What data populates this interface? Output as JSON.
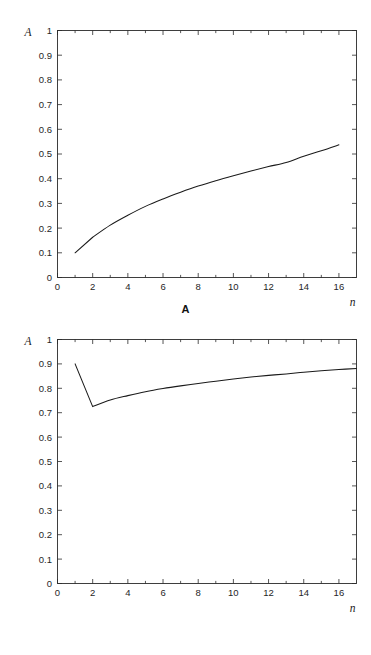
{
  "chart_data": [
    {
      "id": "panel-a",
      "type": "line",
      "title": "",
      "panel_label": "A",
      "xlabel": "n",
      "ylabel": "A",
      "xlim": [
        0,
        17
      ],
      "ylim": [
        0,
        1
      ],
      "grid": false,
      "legend": "none",
      "xticks": [
        0,
        2,
        4,
        6,
        8,
        10,
        12,
        14,
        16
      ],
      "xtick_labels": [
        "0",
        "2",
        "4",
        "6",
        "8",
        "10",
        "12",
        "14",
        "16"
      ],
      "yticks": [
        0,
        0.1,
        0.2,
        0.3,
        0.4,
        0.5,
        0.6,
        0.7,
        0.8,
        0.9,
        1
      ],
      "ytick_labels": [
        "0",
        "0.1",
        "0.2",
        "0.3",
        "0.4",
        "0.5",
        "0.6",
        "0.7",
        "0.8",
        "0.9",
        "1"
      ],
      "x": [
        1,
        2,
        3,
        4,
        5,
        6,
        7,
        8,
        9,
        10,
        11,
        12,
        13,
        14,
        15,
        16
      ],
      "y": [
        0.1,
        0.163,
        0.212,
        0.252,
        0.288,
        0.318,
        0.345,
        0.37,
        0.392,
        0.412,
        0.431,
        0.449,
        0.466,
        0.491,
        0.513,
        0.537
      ]
    },
    {
      "id": "panel-b",
      "type": "line",
      "title": "",
      "panel_label": "B",
      "xlabel": "n",
      "ylabel": "A",
      "xlim": [
        0,
        17
      ],
      "ylim": [
        0,
        1
      ],
      "grid": false,
      "legend": "none",
      "xticks": [
        0,
        2,
        4,
        6,
        8,
        10,
        12,
        14,
        16
      ],
      "xtick_labels": [
        "0",
        "2",
        "4",
        "6",
        "8",
        "10",
        "12",
        "14",
        "16"
      ],
      "yticks": [
        0,
        0.1,
        0.2,
        0.3,
        0.4,
        0.5,
        0.6,
        0.7,
        0.8,
        0.9,
        1
      ],
      "ytick_labels": [
        "0",
        "0.1",
        "0.2",
        "0.3",
        "0.4",
        "0.5",
        "0.6",
        "0.7",
        "0.8",
        "0.9",
        "1"
      ],
      "x": [
        1,
        2,
        3,
        4,
        5,
        6,
        7,
        8,
        9,
        10,
        11,
        12,
        13,
        14,
        15,
        16,
        17
      ],
      "y": [
        0.9,
        0.725,
        0.752,
        0.77,
        0.786,
        0.799,
        0.81,
        0.82,
        0.829,
        0.838,
        0.846,
        0.853,
        0.859,
        0.866,
        0.872,
        0.877,
        0.881
      ]
    }
  ],
  "panels": {
    "a": {
      "caption": "A",
      "y_axis_title": "A",
      "x_axis_title": "n"
    },
    "b": {
      "caption": "B",
      "y_axis_title": "A",
      "x_axis_title": "n"
    }
  }
}
